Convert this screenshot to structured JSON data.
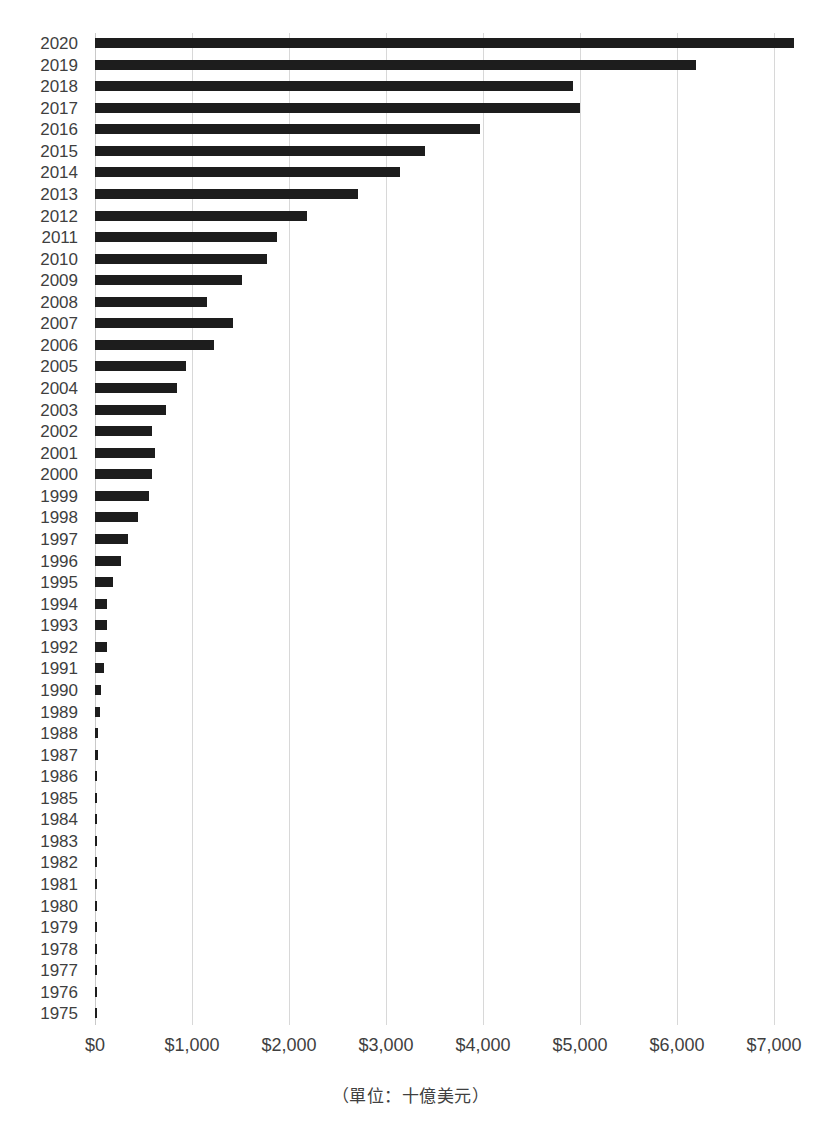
{
  "chart_data": {
    "type": "bar",
    "orientation": "horizontal",
    "title": "",
    "subtitle": "",
    "xlabel": "（單位：十億美元）",
    "ylabel": "",
    "xlim": [
      0,
      7000
    ],
    "ylim": null,
    "grid": "vertical",
    "legend": "none",
    "bar_color": "#1d1d1d",
    "grid_color": "#d8d8d8",
    "x_tick_labels": [
      "$0",
      "$1,000",
      "$2,000",
      "$3,000",
      "$4,000",
      "$5,000",
      "$6,000",
      "$7,000"
    ],
    "x_tick_values": [
      0,
      1000,
      2000,
      3000,
      4000,
      5000,
      6000,
      7000
    ],
    "categories": [
      "2020",
      "2019",
      "2018",
      "2017",
      "2016",
      "2015",
      "2014",
      "2013",
      "2012",
      "2011",
      "2010",
      "2009",
      "2008",
      "2007",
      "2006",
      "2005",
      "2004",
      "2003",
      "2002",
      "2001",
      "2000",
      "1999",
      "1998",
      "1997",
      "1996",
      "1995",
      "1994",
      "1993",
      "1992",
      "1991",
      "1990",
      "1989",
      "1988",
      "1987",
      "1986",
      "1985",
      "1984",
      "1983",
      "1982",
      "1981",
      "1980",
      "1979",
      "1978",
      "1977",
      "1976",
      "1975"
    ],
    "values": [
      7203,
      6192,
      4923,
      5005,
      3973,
      3405,
      3148,
      2714,
      2188,
      1878,
      1775,
      1517,
      1156,
      1424,
      1228,
      939,
      846,
      733,
      588,
      619,
      588,
      557,
      444,
      341,
      268,
      186,
      124,
      124,
      124,
      93,
      62,
      52,
      31,
      26,
      22,
      20,
      18,
      16,
      15,
      14,
      13,
      12,
      11,
      10,
      9,
      8
    ]
  },
  "caption": {
    "unit_note": "（單位：十億美元）"
  }
}
